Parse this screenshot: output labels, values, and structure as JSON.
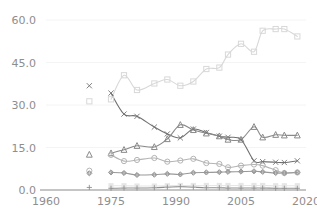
{
  "chart_data": {
    "type": "line",
    "title": "",
    "subtitle": "",
    "xlabel": "",
    "ylabel": "",
    "xlim": [
      1960,
      2020
    ],
    "ylim": [
      0,
      60
    ],
    "xticks": [
      1960,
      1975,
      1990,
      2005,
      2020
    ],
    "xtick_labels": [
      "1960",
      "1975",
      "1990",
      "2005",
      "2020"
    ],
    "yticks": [
      0,
      15,
      30,
      45,
      60
    ],
    "ytick_labels": [
      "0.0",
      "15.0",
      "30.0",
      "45.0",
      "60.0"
    ],
    "grid": "horizontal",
    "legend": "none",
    "series": [
      {
        "name": "series-square",
        "marker": "square",
        "color": "#d8d8d8",
        "x": [
          1970,
          1975,
          1978,
          1981,
          1985,
          1988,
          1991,
          1994,
          1997,
          2000,
          2002,
          2005,
          2008,
          2010,
          2013,
          2015,
          2018
        ],
        "values": [
          31.3,
          32.0,
          40.5,
          35.3,
          37.6,
          39.0,
          36.8,
          38.3,
          42.7,
          43.2,
          47.8,
          51.6,
          48.8,
          56.2,
          56.8,
          56.8,
          54.2
        ]
      },
      {
        "name": "series-cross",
        "marker": "cross",
        "color": "#707070",
        "x": [
          1970,
          1975,
          1978,
          1981,
          1985,
          1988,
          1991,
          1994,
          1997,
          2000,
          2002,
          2005,
          2008,
          2010,
          2013,
          2015,
          2018
        ],
        "values": [
          36.8,
          34.2,
          26.8,
          26.0,
          22.2,
          19.8,
          18.4,
          21.5,
          20.3,
          19.0,
          18.6,
          17.8,
          10.3,
          10.0,
          9.8,
          9.7,
          10.3
        ]
      },
      {
        "name": "series-triangle",
        "marker": "triangle",
        "color": "#8a8a8a",
        "x": [
          1970,
          1975,
          1978,
          1981,
          1985,
          1988,
          1991,
          1994,
          1997,
          2000,
          2002,
          2005,
          2008,
          2010,
          2013,
          2015,
          2018
        ],
        "values": [
          12.5,
          13.0,
          14.2,
          15.6,
          15.2,
          18.0,
          23.0,
          21.2,
          20.0,
          19.0,
          17.8,
          17.8,
          22.3,
          18.6,
          19.5,
          19.3,
          19.3
        ]
      },
      {
        "name": "series-circle",
        "marker": "circle",
        "color": "#b4b4b4",
        "x": [
          1970,
          1975,
          1978,
          1981,
          1985,
          1988,
          1991,
          1994,
          1997,
          2000,
          2002,
          2005,
          2008,
          2010,
          2013,
          2015,
          2018
        ],
        "values": [
          6.8,
          12.4,
          10.2,
          10.6,
          11.3,
          10.0,
          10.4,
          11.0,
          9.5,
          9.2,
          8.0,
          8.6,
          9.0,
          8.6,
          7.0,
          6.0,
          6.2
        ]
      },
      {
        "name": "series-diamond",
        "marker": "diamond",
        "color": "#999999",
        "x": [
          1970,
          1975,
          1978,
          1981,
          1985,
          1988,
          1991,
          1994,
          1997,
          2000,
          2002,
          2005,
          2008,
          2010,
          2013,
          2015,
          2018
        ],
        "values": [
          5.9,
          6.2,
          6.0,
          5.3,
          5.4,
          5.7,
          5.5,
          6.1,
          6.2,
          6.3,
          6.4,
          6.5,
          6.6,
          6.4,
          6.0,
          6.0,
          6.2
        ]
      },
      {
        "name": "series-light-bar",
        "marker": "light-square",
        "color": "#e6e6e6",
        "x": [
          1975,
          1978,
          1981,
          1985,
          1988,
          1991,
          1994,
          1997,
          2000,
          2002,
          2005,
          2008,
          2010,
          2013,
          2015,
          2018
        ],
        "values": [
          1.5,
          1.5,
          1.4,
          1.4,
          1.5,
          1.6,
          1.6,
          1.6,
          1.6,
          1.6,
          1.6,
          1.6,
          1.6,
          1.5,
          1.5,
          1.5
        ]
      },
      {
        "name": "series-plus",
        "marker": "plus",
        "color": "#8e8e8e",
        "x": [
          1970,
          1975,
          1978,
          1981,
          1985,
          1988,
          1991,
          1994,
          1997,
          2000,
          2002,
          2005,
          2008,
          2010,
          2013,
          2015,
          2018
        ],
        "values": [
          0.9,
          0.6,
          0.7,
          0.7,
          0.8,
          1.0,
          1.2,
          1.0,
          0.8,
          0.8,
          0.7,
          0.7,
          0.7,
          0.7,
          0.6,
          0.6,
          0.6
        ]
      }
    ]
  },
  "axes": {
    "y_tick_labels": [
      "60.0",
      "45.0",
      "30.0",
      "15.0",
      "0.0"
    ],
    "x_tick_labels": [
      "1960",
      "1975",
      "1990",
      "2005",
      "2020"
    ]
  }
}
